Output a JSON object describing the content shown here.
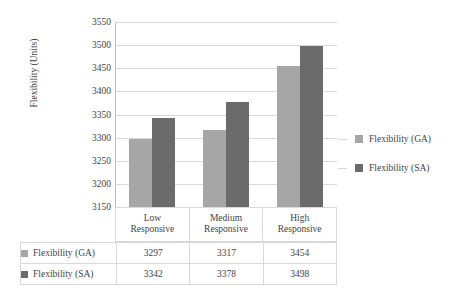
{
  "chart_data": {
    "type": "bar",
    "title": "",
    "xlabel": "",
    "ylabel": "Flexibility (Units)",
    "categories": [
      "Low\nResponsive",
      "Medium\nResponsive",
      "High\nResponsive"
    ],
    "category_lines": [
      [
        "Low",
        "Responsive"
      ],
      [
        "Medium",
        "Responsive"
      ],
      [
        "High",
        "Responsive"
      ]
    ],
    "series": [
      {
        "name": "Flexibility (GA)",
        "values": [
          3297,
          3317,
          3454
        ],
        "color": "#a6a6a6"
      },
      {
        "name": "Flexibility (SA)",
        "values": [
          3342,
          3378,
          3498
        ],
        "color": "#6b6b6b"
      }
    ],
    "ylim": [
      3150,
      3550
    ],
    "ytick_step": 50,
    "yticks": [
      3550,
      3500,
      3450,
      3400,
      3350,
      3300,
      3250,
      3200,
      3150
    ],
    "ytick_labels": [
      "3550",
      "3500",
      "3450",
      "3400",
      "3350",
      "3300",
      "3250",
      "3200",
      "3150"
    ],
    "grid": true,
    "legend_position": "right",
    "data_table_visible": true
  },
  "legend": {
    "entries": [
      {
        "label": "Flexibility (GA)",
        "color": "#a6a6a6"
      },
      {
        "label": "Flexibility (SA)",
        "color": "#6b6b6b"
      }
    ]
  },
  "table": {
    "rows": [
      {
        "name": "Flexibility (GA)",
        "color": "#a6a6a6",
        "cells": [
          "3297",
          "3317",
          "3454"
        ]
      },
      {
        "name": "Flexibility (SA)",
        "color": "#6b6b6b",
        "cells": [
          "3342",
          "3378",
          "3498"
        ]
      }
    ]
  },
  "colors": {
    "series_ga": "#a6a6a6",
    "series_sa": "#6b6b6b",
    "gridline": "#d9d9d9",
    "axis": "#bfbfbf",
    "text": "#3f3f3f",
    "background": "#ffffff"
  }
}
